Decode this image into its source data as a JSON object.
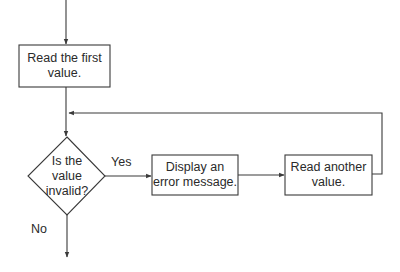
{
  "diagram": {
    "type": "flowchart",
    "stroke_color": "#3a3a3a",
    "nodes": [
      {
        "id": "read_first",
        "shape": "rectangle",
        "label": "Read the first\nvalue."
      },
      {
        "id": "is_invalid",
        "shape": "diamond",
        "label": "Is the\nvalue\ninvalid?"
      },
      {
        "id": "display_error",
        "shape": "rectangle",
        "label": "Display an\nerror message."
      },
      {
        "id": "read_another",
        "shape": "rectangle",
        "label": "Read another\nvalue."
      }
    ],
    "edges": [
      {
        "from": "start",
        "to": "read_first",
        "label": ""
      },
      {
        "from": "read_first",
        "to": "is_invalid",
        "label": ""
      },
      {
        "from": "is_invalid",
        "to": "display_error",
        "label": "Yes"
      },
      {
        "from": "display_error",
        "to": "read_another",
        "label": ""
      },
      {
        "from": "read_another",
        "to": "is_invalid",
        "label": ""
      },
      {
        "from": "is_invalid",
        "to": "end",
        "label": "No"
      }
    ],
    "labels": {
      "yes": "Yes",
      "no": "No"
    }
  }
}
